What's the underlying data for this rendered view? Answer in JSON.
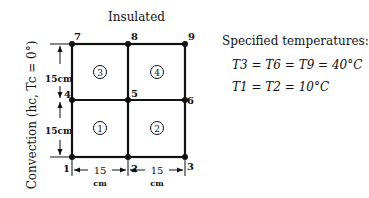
{
  "diagram": {
    "top_label": "Insulated",
    "left_label": "Convection (h_c, T_c = 0°)",
    "left_label_display": "Convection (hc, Tc = 0°)",
    "nodes": [
      {
        "id": "1",
        "x": 72,
        "y": 157
      },
      {
        "id": "2",
        "x": 128,
        "y": 157
      },
      {
        "id": "3",
        "x": 185,
        "y": 157
      },
      {
        "id": "4",
        "x": 72,
        "y": 100
      },
      {
        "id": "5",
        "x": 128,
        "y": 100
      },
      {
        "id": "6",
        "x": 185,
        "y": 100
      },
      {
        "id": "7",
        "x": 72,
        "y": 44
      },
      {
        "id": "8",
        "x": 128,
        "y": 44
      },
      {
        "id": "9",
        "x": 185,
        "y": 44
      }
    ],
    "elements": [
      {
        "id": "①",
        "label": "1"
      },
      {
        "id": "②",
        "label": "2"
      },
      {
        "id": "③",
        "label": "3"
      },
      {
        "id": "④",
        "label": "4"
      }
    ],
    "dimensions": {
      "vertical_upper": "15cm",
      "vertical_lower": "15cm",
      "horizontal_left_value": "15",
      "horizontal_left_unit": "cm",
      "horizontal_right_value": "15",
      "horizontal_right_unit": "cm"
    },
    "specified": {
      "heading": "Specified temperatures:",
      "line1": "T3 = T6 = T9 = 40°C",
      "line2": "T1 = T2 = 10°C"
    }
  }
}
